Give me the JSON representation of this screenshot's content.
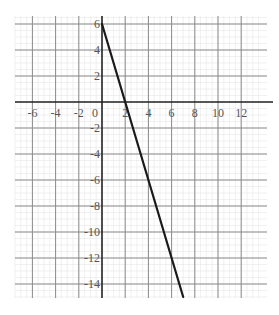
{
  "chart_data": {
    "type": "line",
    "title": "",
    "xlabel": "",
    "ylabel": "",
    "xlim": [
      -8.5,
      13.5
    ],
    "ylim": [
      -15,
      6.5
    ],
    "grid": true,
    "x_ticks": [
      {
        "value": -6,
        "label": "-6"
      },
      {
        "value": -4,
        "label": "-4"
      },
      {
        "value": -2,
        "label": "-2"
      },
      {
        "value": 0,
        "label": "0"
      },
      {
        "value": 2,
        "label": "2"
      },
      {
        "value": 4,
        "label": "4"
      },
      {
        "value": 6,
        "label": "6"
      },
      {
        "value": 8,
        "label": "8"
      },
      {
        "value": 10,
        "label": "10"
      },
      {
        "value": 12,
        "label": "12"
      }
    ],
    "y_ticks": [
      {
        "value": 6,
        "label": "6"
      },
      {
        "value": 4,
        "label": "4"
      },
      {
        "value": 2,
        "label": "2"
      },
      {
        "value": -2,
        "label": "-2"
      },
      {
        "value": -4,
        "label": "-4"
      },
      {
        "value": -6,
        "label": "-6"
      },
      {
        "value": -8,
        "label": "-8"
      },
      {
        "value": -10,
        "label": "-10"
      },
      {
        "value": -12,
        "label": "-12"
      },
      {
        "value": -14,
        "label": "-14"
      }
    ],
    "series": [
      {
        "name": "y = -3x + 6",
        "x": [
          0,
          2,
          7
        ],
        "y": [
          6,
          0,
          -15
        ],
        "color": "#1a1a1a"
      }
    ]
  },
  "colors": {
    "axis": "#222222",
    "major_grid": "#8a8a8a",
    "minor_grid": "#e6e6e6",
    "line": "#1a1a1a",
    "label": "#555555"
  }
}
